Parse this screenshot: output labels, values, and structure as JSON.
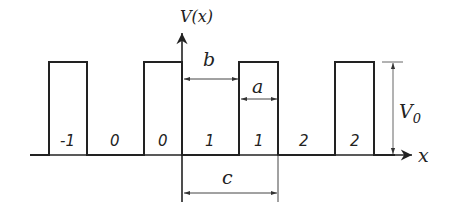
{
  "diagram": {
    "type": "periodic rectangular potential (Kronig-Penney)",
    "axis_y_label": "V(x)",
    "axis_x_label": "x",
    "dimension_labels": {
      "b": "b",
      "a": "a",
      "c": "c",
      "height": "V",
      "height_sub": "0"
    },
    "cell_indices": [
      "-1",
      "0",
      "0",
      "1",
      "1",
      "2",
      "2"
    ],
    "colors": {
      "line": "#222222",
      "dim_line": "#555555",
      "background": "#ffffff"
    }
  }
}
